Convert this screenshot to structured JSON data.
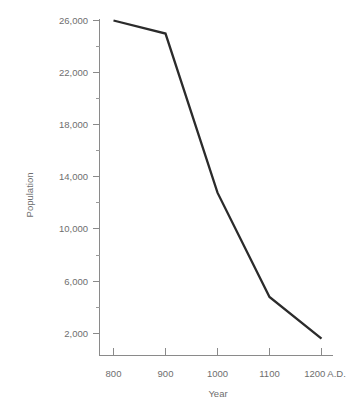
{
  "chart_data": {
    "type": "line",
    "title": "",
    "xlabel": "Year",
    "ylabel": "Population",
    "x": [
      800,
      900,
      1000,
      1100,
      1200
    ],
    "categories": [
      "800",
      "900",
      "1000",
      "1100",
      "1200 A.D."
    ],
    "values": [
      26000,
      25000,
      12800,
      4800,
      1600
    ],
    "series": [
      {
        "name": "Population",
        "values": [
          26000,
          25000,
          12800,
          4800,
          1600
        ]
      }
    ],
    "xlim": [
      800,
      1200
    ],
    "ylim": [
      0,
      26000
    ],
    "x_tick_labels": [
      "800",
      "900",
      "1000",
      "1100",
      "1200 A.D."
    ],
    "y_tick_labels": [
      "26,000",
      "22,000",
      "18,000",
      "14,000",
      "10,000",
      "6,000",
      "2,000"
    ],
    "y_tick_values": [
      26000,
      22000,
      18000,
      14000,
      10000,
      6000,
      2000
    ],
    "y_minor_tick_values": [
      24000,
      20000,
      16000,
      12000,
      8000,
      4000
    ],
    "grid": false,
    "legend": "none",
    "line_color": "#2b2b2b",
    "axis_color": "#8a8a8a",
    "text_color": "#6e6e6e",
    "background": "#ffffff"
  },
  "axes": {
    "y_title": "Population",
    "x_title": "Year"
  }
}
